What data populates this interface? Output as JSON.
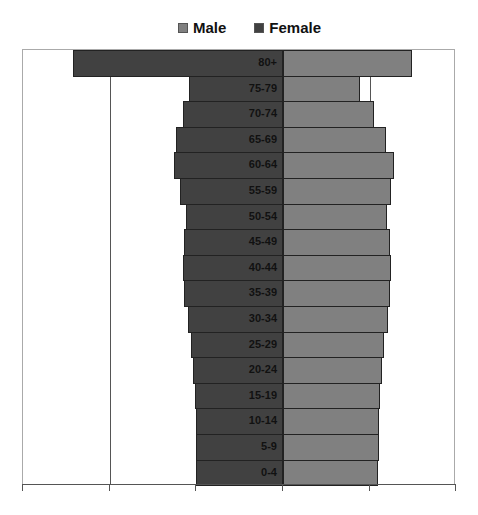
{
  "chart_data": {
    "type": "bar",
    "orientation": "horizontal",
    "subtype": "population-pyramid",
    "title": "",
    "xlabel": "",
    "ylabel": "",
    "legend": [
      "Male",
      "Female"
    ],
    "legend_position": "top",
    "grid": true,
    "x_tick_labels_visible": false,
    "units_note": "Values in gridline units (no axis labels shown); one gridline interval = 1",
    "categories": [
      "80+",
      "75-79",
      "70-74",
      "65-69",
      "60-64",
      "55-59",
      "50-54",
      "45-49",
      "40-44",
      "35-39",
      "30-34",
      "25-29",
      "20-24",
      "15-19",
      "10-14",
      "5-9",
      "0-4"
    ],
    "series": [
      {
        "name": "Male",
        "color": "#808080",
        "values": [
          1.49,
          0.89,
          1.05,
          1.19,
          1.28,
          1.25,
          1.2,
          1.24,
          1.25,
          1.24,
          1.21,
          1.17,
          1.14,
          1.12,
          1.11,
          1.11,
          1.1
        ]
      },
      {
        "name": "Female",
        "color": "#414141",
        "values": [
          2.43,
          1.09,
          1.16,
          1.23,
          1.26,
          1.19,
          1.12,
          1.14,
          1.16,
          1.14,
          1.1,
          1.06,
          1.04,
          1.02,
          1.01,
          1.01,
          1.01
        ]
      }
    ],
    "xlim": [
      -3,
      2
    ]
  },
  "legend": {
    "male_label": "Male",
    "female_label": "Female"
  }
}
